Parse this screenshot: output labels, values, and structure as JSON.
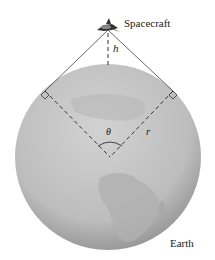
{
  "labels": {
    "spacecraft": "Spacecraft",
    "earth": "Earth",
    "height": "h",
    "radius": "r",
    "angle": "θ"
  },
  "colors": {
    "globe_light": "#c9c9c9",
    "globe_dark": "#8a8a8a",
    "land": "#b3b3b3",
    "line": "#333333"
  }
}
